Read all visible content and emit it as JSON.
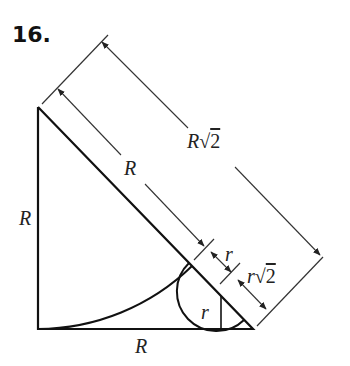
{
  "problem": {
    "number": "16."
  },
  "labels": {
    "left_side": "R",
    "bottom_side": "R",
    "hyp_segment": "R",
    "hyp_total_var": "R",
    "hyp_total_sqrt": "√",
    "hyp_total_rad": "2",
    "small_gap": "r",
    "small_total_var": "r",
    "small_total_sqrt": "√",
    "small_total_rad": "2",
    "small_radius": "r"
  },
  "colors": {
    "stroke": "#111111",
    "dim": "#333333"
  }
}
